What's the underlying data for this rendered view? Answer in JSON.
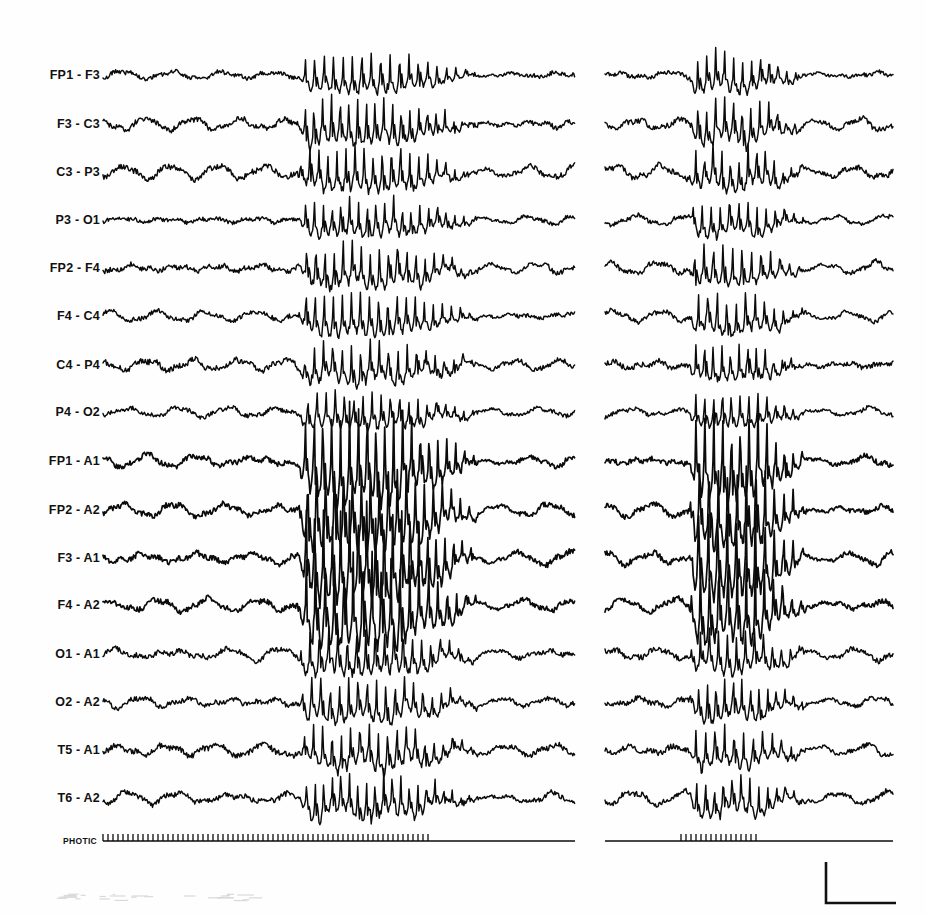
{
  "figure": {
    "kind": "eeg-recording",
    "ink_color": "#0b0b0b",
    "background_color": "#ffffff",
    "panel_count": 2
  },
  "channels": [
    {
      "label": "FP1 - F3",
      "baseline_y": 75
    },
    {
      "label": "F3 - C3",
      "baseline_y": 124
    },
    {
      "label": "C3 - P3",
      "baseline_y": 172
    },
    {
      "label": "P3 - O1",
      "baseline_y": 220
    },
    {
      "label": "FP2 - F4",
      "baseline_y": 268
    },
    {
      "label": "F4 - C4",
      "baseline_y": 316
    },
    {
      "label": "C4 - P4",
      "baseline_y": 365
    },
    {
      "label": "P4 - O2",
      "baseline_y": 412
    },
    {
      "label": "FP1 - A1",
      "baseline_y": 461
    },
    {
      "label": "FP2 - A2",
      "baseline_y": 510
    },
    {
      "label": "F3 - A1",
      "baseline_y": 558
    },
    {
      "label": "F4 - A2",
      "baseline_y": 605
    },
    {
      "label": "O1 - A1",
      "baseline_y": 654
    },
    {
      "label": "O2 - A2",
      "baseline_y": 702
    },
    {
      "label": "T5 - A1",
      "baseline_y": 750
    },
    {
      "label": "T6 - A2",
      "baseline_y": 798
    }
  ],
  "photic": {
    "label": "PHOTIC",
    "baseline_y": 841,
    "left_panel": {
      "line_start_x": 103,
      "line_end_x": 575,
      "ticks_start_x": 103,
      "ticks_end_x": 430,
      "tick_spacing": 5.0,
      "tick_height": 7
    },
    "right_panel": {
      "line_start_x": 605,
      "line_end_x": 893,
      "ticks_start_x": 681,
      "ticks_end_x": 757,
      "tick_spacing": 5.0,
      "tick_height": 7
    }
  },
  "panels": [
    {
      "name": "left-panel",
      "x_start": 103,
      "x_end": 575,
      "burst_start_x": 297,
      "burst_end_x": 478
    },
    {
      "name": "right-panel",
      "x_start": 605,
      "x_end": 893,
      "burst_start_x": 689,
      "burst_end_x": 806
    }
  ],
  "calibration": {
    "name": "calibration-marker",
    "corner_x": 826,
    "top_y": 862,
    "bottom_y": 903,
    "right_x": 896
  },
  "chart_data": {
    "type": "line",
    "title": "",
    "xlabel": "",
    "ylabel": "",
    "grid": false,
    "legend": "none",
    "series_names": [
      "FP1 - F3",
      "F3 - C3",
      "C3 - P3",
      "P3 - O1",
      "FP2 - F4",
      "F4 - C4",
      "C4 - P4",
      "P4 - O2",
      "FP1 - A1",
      "FP2 - A2",
      "F3 - A1",
      "F4 - A2",
      "O1 - A1",
      "O2 - A2",
      "T5 - A1",
      "T6 - A2",
      "PHOTIC"
    ],
    "background_rhythm_hz": 9,
    "burst_rhythm_hz": 3,
    "channel_amplitudes": [
      {
        "label": "FP1 - F3",
        "background_amp": 5.5,
        "burst_amp": 17
      },
      {
        "label": "F3 - C3",
        "background_amp": 7.0,
        "burst_amp": 20
      },
      {
        "label": "C3 - P3",
        "background_amp": 7.5,
        "burst_amp": 19
      },
      {
        "label": "P3 - O1",
        "background_amp": 5.5,
        "burst_amp": 16
      },
      {
        "label": "FP2 - F4",
        "background_amp": 6.5,
        "burst_amp": 19
      },
      {
        "label": "F4 - C4",
        "background_amp": 6.0,
        "burst_amp": 19
      },
      {
        "label": "C4 - P4",
        "background_amp": 7.5,
        "burst_amp": 17
      },
      {
        "label": "P4 - O2",
        "background_amp": 5.5,
        "burst_amp": 16
      },
      {
        "label": "FP1 - A1",
        "background_amp": 7.0,
        "burst_amp": 40
      },
      {
        "label": "FP2 - A2",
        "background_amp": 7.0,
        "burst_amp": 40
      },
      {
        "label": "F3 - A1",
        "background_amp": 7.5,
        "burst_amp": 42
      },
      {
        "label": "F4 - A2",
        "background_amp": 7.0,
        "burst_amp": 40
      },
      {
        "label": "O1 - A1",
        "background_amp": 7.0,
        "burst_amp": 20
      },
      {
        "label": "O2 - A2",
        "background_amp": 6.5,
        "burst_amp": 19
      },
      {
        "label": "T5 - A1",
        "background_amp": 7.5,
        "burst_amp": 18
      },
      {
        "label": "T6 - A2",
        "background_amp": 7.0,
        "burst_amp": 18
      }
    ]
  }
}
